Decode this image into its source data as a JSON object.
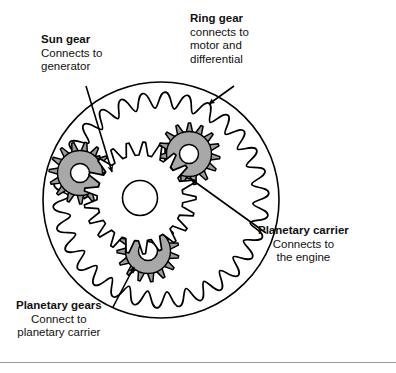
{
  "figure": {
    "background_color": "#ffffff",
    "stroke_color": "#000000",
    "carrier_fill": "#a8a8a8",
    "planet_fill": "#9d9d9d",
    "divider_color": "#9a9a9a"
  },
  "callouts": {
    "sun_gear": {
      "title": "Sun gear",
      "line1": "Connects to",
      "line2": "generator"
    },
    "ring_gear": {
      "title": "Ring gear",
      "line1": "connects to",
      "line2": "motor and",
      "line3": "differential"
    },
    "planetary_carrier": {
      "title": "Planetary carrier",
      "line1": "Connects to",
      "line2": "the engine"
    },
    "planetary_gears": {
      "title": "Planetary gears",
      "line1": "Connect to",
      "line2": "planetary carrier"
    }
  },
  "diagram_parts": {
    "ring_gear_outer_circle": "ring-gear-outer-circle",
    "ring_gear_teeth": "ring-gear-internal-teeth",
    "sun_gear": "sun-gear",
    "sun_gear_hub": "sun-gear-hub",
    "planet_gear_left": "planet-gear-left",
    "planet_gear_top_right": "planet-gear-top-right",
    "planet_gear_bottom": "planet-gear-bottom",
    "carrier_plate": "planetary-carrier-plate"
  }
}
